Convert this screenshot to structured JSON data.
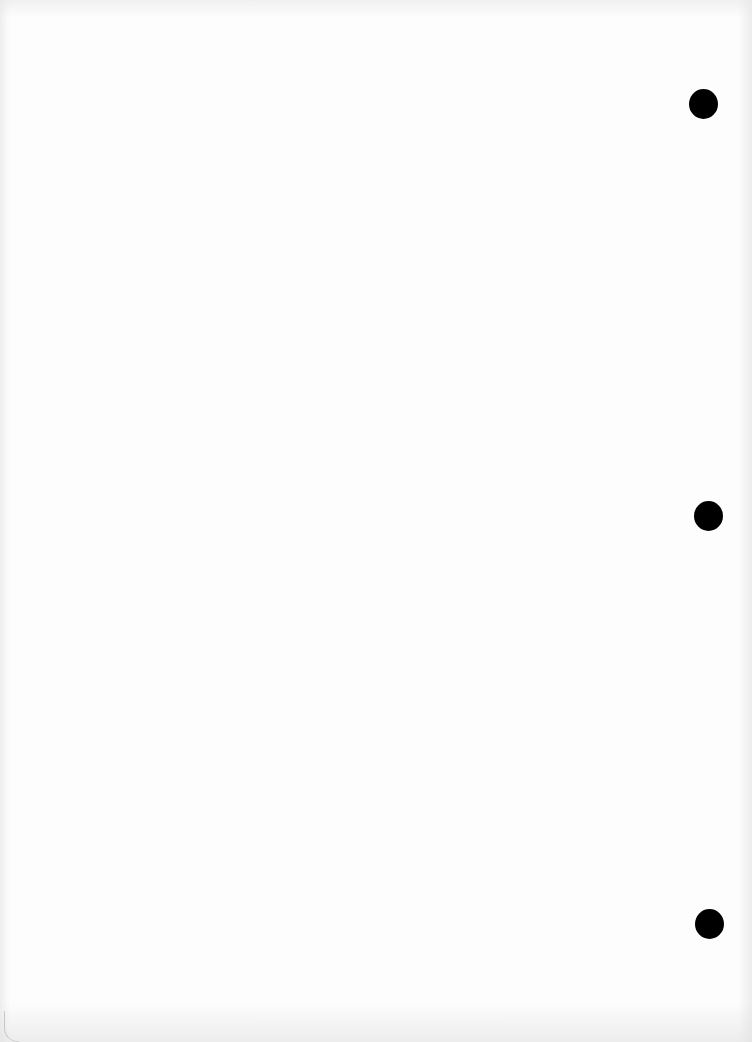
{
  "document": {
    "type": "blank scanned page",
    "text_content": "",
    "background_color": "#fdfdfd",
    "punch_holes": [
      {
        "name": "top-hole",
        "cx": 703,
        "cy": 104,
        "color": "#000000"
      },
      {
        "name": "middle-hole",
        "cx": 708,
        "cy": 516,
        "color": "#000000"
      },
      {
        "name": "bottom-hole",
        "cx": 709,
        "cy": 924,
        "color": "#000000"
      }
    ]
  }
}
